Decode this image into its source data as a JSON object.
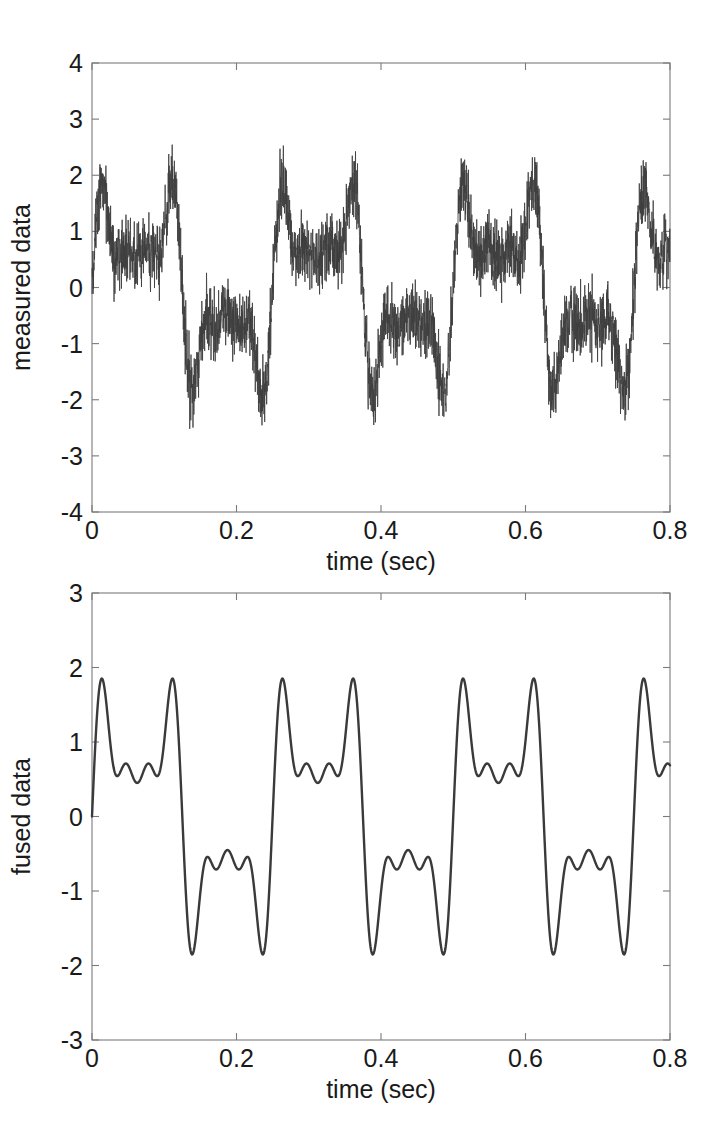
{
  "figure": {
    "width": 724,
    "height": 1144,
    "background": "#ffffff",
    "line_color": "#3a3a3a",
    "axis_color": "#7a7a7a"
  },
  "chart_data": [
    {
      "type": "line",
      "panel": "top",
      "title": "",
      "xlabel": "time (sec)",
      "ylabel": "measured data",
      "xlim": [
        0,
        0.8
      ],
      "ylim": [
        -4,
        4
      ],
      "xticks": [
        0,
        0.2,
        0.4,
        0.6,
        0.8
      ],
      "xticklabels": [
        "0",
        "0.2",
        "0.4",
        "0.6",
        "0.8"
      ],
      "yticks": [
        -4,
        -3,
        -2,
        -1,
        0,
        1,
        2,
        3,
        4
      ],
      "yticklabels": [
        "-4",
        "-3",
        "-2",
        "-1",
        "0",
        "1",
        "2",
        "3",
        "4"
      ],
      "grid": false,
      "legend": null,
      "series": [
        {
          "name": "measured data",
          "description": "clean multi-tone signal plus additive broadband noise",
          "color": "#3f3f3f",
          "noise_amplitude": 0.45,
          "n_samples": 3200,
          "components": [
            {
              "amplitude": 1.0,
              "frequency_hz": 4,
              "phase_rad": 0.0
            },
            {
              "amplitude": 0.8,
              "frequency_hz": 12,
              "phase_rad": 0.0
            },
            {
              "amplitude": 0.6,
              "frequency_hz": 20,
              "phase_rad": 0.0
            },
            {
              "amplitude": 0.35,
              "frequency_hz": 28,
              "phase_rad": 0.0
            }
          ]
        }
      ]
    },
    {
      "type": "line",
      "panel": "bottom",
      "title": "",
      "xlabel": "time (sec)",
      "ylabel": "fused data",
      "xlim": [
        0,
        0.8
      ],
      "ylim": [
        -3,
        3
      ],
      "xticks": [
        0,
        0.2,
        0.4,
        0.6,
        0.8
      ],
      "xticklabels": [
        "0",
        "0.2",
        "0.4",
        "0.6",
        "0.8"
      ],
      "yticks": [
        -3,
        -2,
        -1,
        0,
        1,
        2,
        3
      ],
      "yticklabels": [
        "-3",
        "-2",
        "-1",
        "0",
        "1",
        "2",
        "3"
      ],
      "grid": false,
      "legend": null,
      "series": [
        {
          "name": "fused data",
          "description": "denoised multi-tone signal, period 0.25 s",
          "color": "#3a3a3a",
          "noise_amplitude": 0.0,
          "n_samples": 1600,
          "components": [
            {
              "amplitude": 1.0,
              "frequency_hz": 4,
              "phase_rad": 0.0
            },
            {
              "amplitude": 0.8,
              "frequency_hz": 12,
              "phase_rad": 0.0
            },
            {
              "amplitude": 0.6,
              "frequency_hz": 20,
              "phase_rad": 0.0
            },
            {
              "amplitude": 0.35,
              "frequency_hz": 28,
              "phase_rad": 0.0
            }
          ],
          "peak_max": 2.45,
          "peak_min": -2.55
        }
      ]
    }
  ]
}
